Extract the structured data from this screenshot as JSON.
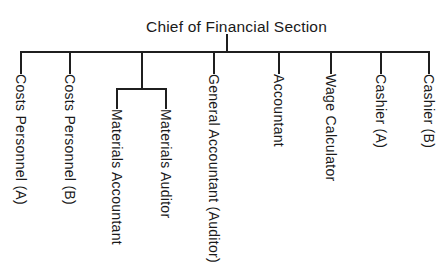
{
  "caption_partial": "Chart . The Organization of the Financial Section",
  "diagram": {
    "root": "Chief of Financial Section",
    "children": [
      {
        "label": "Costs Personnel (A)"
      },
      {
        "label": "Costs Personnel (B)"
      },
      {
        "label": null,
        "children": [
          {
            "label": "Materials Accountant"
          },
          {
            "label": "Materials Auditor"
          }
        ]
      },
      {
        "label": "General Accountant (Auditor)"
      },
      {
        "label": "Accountant"
      },
      {
        "label": "Wage Calculator"
      },
      {
        "label": "Cashier (A)"
      },
      {
        "label": "Cashier (B)"
      }
    ]
  },
  "labels": {
    "costs_a": "Costs Personnel (A)",
    "costs_b": "Costs Personnel (B)",
    "mat_accountant": "Materials Accountant",
    "mat_auditor": "Materials Auditor",
    "general": "General Accountant (Auditor)",
    "accountant": "Accountant",
    "wage": "Wage Calculator",
    "cashier_a": "Cashier (A)",
    "cashier_b": "Cashier (B)"
  },
  "colors": {
    "line": "#1f1f1f",
    "text": "#1a1a1a",
    "background": "#ffffff"
  }
}
